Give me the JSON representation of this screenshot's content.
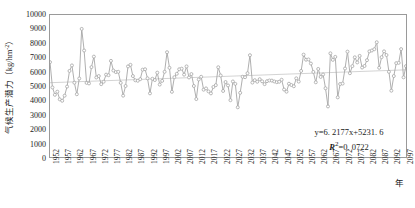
{
  "chart_data": {
    "type": "line",
    "title": "",
    "xlabel": "年",
    "ylabel": "气候生产潜力（kg/hm⁻²）",
    "ylabel_cjk": "气候生产潜力",
    "ylabel_unit": "（kg/hm",
    "ylabel_unit_sup": "-2",
    "ylabel_unit_tail": "）",
    "xlim": [
      1952,
      2098
    ],
    "ylim": [
      0,
      10000
    ],
    "ytick_step": 1000,
    "xtick_step": 5,
    "grid": false,
    "legend": "none",
    "marker": "circle",
    "line_color": "#a6a6a6",
    "marker_color": "#a6a6a6",
    "trend_color": "#c8c8c8",
    "axis_color": "#9a9a9a",
    "yticks": [
      0,
      1000,
      2000,
      3000,
      4000,
      5000,
      6000,
      7000,
      8000,
      9000,
      10000
    ],
    "xticks": [
      1952,
      1957,
      1962,
      1967,
      1972,
      1977,
      1982,
      1987,
      1992,
      1997,
      2002,
      2007,
      2012,
      2017,
      2022,
      2027,
      2032,
      2037,
      2042,
      2047,
      2052,
      2057,
      2062,
      2067,
      2072,
      2077,
      2082,
      2087,
      2092,
      2097
    ],
    "annotations": [
      {
        "name": "regression-equation",
        "text": "y=6. 2177x+5231. 6"
      },
      {
        "name": "r-squared",
        "text": "=0. 0722",
        "prefix": "R",
        "sup": "2"
      }
    ],
    "trendline": {
      "slope": 6.2177,
      "intercept": 5231.6,
      "r2": 0.0722,
      "x0": 1952,
      "x1": 2098
    },
    "series": [
      {
        "name": "气候生产潜力",
        "x_start": 1952,
        "values": [
          6680,
          4900,
          4380,
          4600,
          4060,
          3960,
          4320,
          4960,
          6060,
          6450,
          5230,
          4420,
          5530,
          9020,
          7500,
          5220,
          5180,
          6330,
          7070,
          5600,
          5700,
          5130,
          5300,
          5800,
          5760,
          6770,
          6090,
          5980,
          6000,
          5220,
          4320,
          5000,
          6380,
          6490,
          5700,
          5400,
          5370,
          5480,
          6150,
          6180,
          5540,
          4480,
          5510,
          5420,
          5940,
          5100,
          5360,
          6000,
          7380,
          6280,
          4590,
          5620,
          5860,
          6180,
          6220,
          5800,
          6380,
          5600,
          5840,
          5000,
          4080,
          5460,
          5650,
          4740,
          4830,
          4620,
          4480,
          4930,
          5060,
          6320,
          5740,
          4650,
          5280,
          5040,
          4000,
          5320,
          5150,
          3500,
          4520,
          5650,
          5620,
          5900,
          7170,
          5240,
          5410,
          5300,
          5480,
          5330,
          5130,
          5340,
          5390,
          5380,
          5320,
          5270,
          5300,
          5440,
          4750,
          4600,
          5160,
          5070,
          4980,
          5540,
          5310,
          6060,
          7210,
          6850,
          6870,
          6580,
          5990,
          5260,
          6200,
          5640,
          5810,
          4840,
          3560,
          7300,
          6840,
          7050,
          4200,
          5140,
          5170,
          6230,
          7420,
          5900,
          6400,
          7020,
          6660,
          7120,
          6300,
          6410,
          6820,
          7440,
          7500,
          7590,
          8080,
          6280,
          7030,
          7440,
          7180,
          6000,
          4670,
          5700,
          6610,
          6630,
          7600,
          5610,
          6400,
          6500
        ]
      }
    ]
  }
}
